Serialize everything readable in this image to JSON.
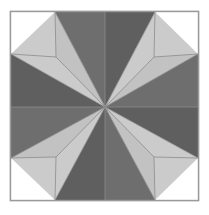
{
  "figure": {
    "name": "eight-pointed-star-quilt-block",
    "canvas": {
      "width": 209,
      "height": 215
    },
    "background_color": "#ffffff"
  },
  "palette": {
    "background": "#ffffff",
    "dark_gray": "#6e6e6e",
    "light_gray": "#cbcbcb",
    "white_patch": "#ffffff",
    "outline": "#8c8c8c",
    "border": "#9a9a9a"
  },
  "block": {
    "frame": {
      "name": "outer-border-square",
      "x": 10.5,
      "y": 11.5,
      "width": 188,
      "height": 189,
      "stroke": "#9a9a9a",
      "stroke_width": 1.4,
      "fill": "#ffffff"
    },
    "center": {
      "x": 105,
      "y": 107
    },
    "star_points": 8,
    "geometry_note": "Eight elongated diamonds meet at the center; tips land on the frame corners and on frame edge midpoints.",
    "diamonds": [
      {
        "name": "star-diamond-n",
        "direction": "north",
        "shade": "dark",
        "fill": "#6e6e6e",
        "points": "105,107 55,12 105,12 155,12"
      },
      {
        "name": "star-diamond-ne",
        "direction": "northeast",
        "shade": "light",
        "fill": "#cbcbcb",
        "points": "105,107 155,12 198,54 154,57"
      },
      {
        "name": "star-diamond-e",
        "direction": "east",
        "shade": "dark",
        "fill": "#6e6e6e",
        "points": "105,107 198,54 198,107 198,158"
      },
      {
        "name": "star-diamond-se",
        "direction": "southeast",
        "shade": "light",
        "fill": "#cbcbcb",
        "points": "105,107 198,158 155,200 154,157"
      },
      {
        "name": "star-diamond-s",
        "direction": "south",
        "shade": "dark",
        "fill": "#6e6e6e",
        "points": "105,107 155,200 105,200 55,200"
      },
      {
        "name": "star-diamond-sw",
        "direction": "southwest",
        "shade": "light",
        "fill": "#cbcbcb",
        "points": "105,107 55,200 11,158 56,157"
      },
      {
        "name": "star-diamond-w",
        "direction": "west",
        "shade": "dark",
        "fill": "#6e6e6e",
        "points": "105,107 11,158 11,107 11,54"
      },
      {
        "name": "star-diamond-nw",
        "direction": "northwest",
        "shade": "light",
        "fill": "#cbcbcb",
        "points": "105,107 11,54 55,12 56,57"
      }
    ],
    "corner_patches": [
      {
        "name": "corner-square-nw",
        "corner": "top-left",
        "fill": "#ffffff",
        "points": "11,12 55,12 56,57 11,54"
      },
      {
        "name": "corner-square-ne",
        "corner": "top-right",
        "fill": "#ffffff",
        "points": "155,12 198,12 198,54 154,57"
      },
      {
        "name": "corner-square-se",
        "corner": "bottom-right",
        "fill": "#ffffff",
        "points": "198,158 198,200 155,200 154,157"
      },
      {
        "name": "corner-square-sw",
        "corner": "bottom-left",
        "fill": "#ffffff",
        "points": "11,158 56,157 55,200 11,200"
      }
    ],
    "edge_triangles": [
      {
        "name": "edge-triangle-north",
        "edge": "top",
        "fill": "#ffffff",
        "points": "55,12 155,12 105,107"
      },
      {
        "name": "edge-triangle-east",
        "edge": "right",
        "fill": "#ffffff",
        "points": "198,54 198,158 105,107"
      },
      {
        "name": "edge-triangle-south",
        "edge": "bottom",
        "fill": "#ffffff",
        "points": "55,200 155,200 105,107"
      },
      {
        "name": "edge-triangle-west",
        "edge": "left",
        "fill": "#ffffff",
        "points": "11,54 11,158 105,107"
      }
    ],
    "diamond_halves": [
      {
        "name": "diamond-half-n-left",
        "parent": "north",
        "fill": "#6e6e6e",
        "points": "105,107 55,12 105,12"
      },
      {
        "name": "diamond-half-n-right",
        "parent": "north",
        "fill": "#5f5f5f",
        "points": "105,107 105,12 155,12"
      },
      {
        "name": "diamond-half-ne-out",
        "parent": "northeast",
        "fill": "#cbcbcb",
        "points": "105,107 155,12 198,54"
      },
      {
        "name": "diamond-half-ne-in",
        "parent": "northeast",
        "fill": "#c2c2c2",
        "points": "105,107 198,54 154,57"
      },
      {
        "name": "diamond-half-e-top",
        "parent": "east",
        "fill": "#6e6e6e",
        "points": "105,107 198,54 198,107"
      },
      {
        "name": "diamond-half-e-bot",
        "parent": "east",
        "fill": "#5f5f5f",
        "points": "105,107 198,107 198,158"
      },
      {
        "name": "diamond-half-se-out",
        "parent": "southeast",
        "fill": "#cbcbcb",
        "points": "105,107 198,158 155,200"
      },
      {
        "name": "diamond-half-se-in",
        "parent": "southeast",
        "fill": "#c2c2c2",
        "points": "105,107 155,200 154,157"
      },
      {
        "name": "diamond-half-s-right",
        "parent": "south",
        "fill": "#6e6e6e",
        "points": "105,107 155,200 105,200"
      },
      {
        "name": "diamond-half-s-left",
        "parent": "south",
        "fill": "#5f5f5f",
        "points": "105,107 105,200 55,200"
      },
      {
        "name": "diamond-half-sw-out",
        "parent": "southwest",
        "fill": "#cbcbcb",
        "points": "105,107 55,200 11,158"
      },
      {
        "name": "diamond-half-sw-in",
        "parent": "southwest",
        "fill": "#c2c2c2",
        "points": "105,107 11,158 56,157"
      },
      {
        "name": "diamond-half-w-bot",
        "parent": "west",
        "fill": "#6e6e6e",
        "points": "105,107 11,158 11,107"
      },
      {
        "name": "diamond-half-w-top",
        "parent": "west",
        "fill": "#5f5f5f",
        "points": "105,107 11,107 11,54"
      },
      {
        "name": "diamond-half-nw-out",
        "parent": "northwest",
        "fill": "#cbcbcb",
        "points": "105,107 11,54 55,12"
      },
      {
        "name": "diamond-half-nw-in",
        "parent": "northwest",
        "fill": "#c2c2c2",
        "points": "105,107 55,12 56,57"
      }
    ],
    "seam_lines": [
      {
        "name": "seam-center-to-nw-corner",
        "x1": 11,
        "y1": 54,
        "x2": 105,
        "y2": 107
      },
      {
        "name": "seam-center-to-n-left",
        "x1": 55,
        "y1": 12,
        "x2": 105,
        "y2": 107
      },
      {
        "name": "seam-center-to-n-mid",
        "x1": 105,
        "y1": 12,
        "x2": 105,
        "y2": 107
      },
      {
        "name": "seam-center-to-n-right",
        "x1": 155,
        "y1": 12,
        "x2": 105,
        "y2": 107
      },
      {
        "name": "seam-center-to-ne-corner",
        "x1": 198,
        "y1": 54,
        "x2": 105,
        "y2": 107
      },
      {
        "name": "seam-center-to-e-mid",
        "x1": 198,
        "y1": 107,
        "x2": 105,
        "y2": 107
      },
      {
        "name": "seam-center-to-se-corner",
        "x1": 198,
        "y1": 158,
        "x2": 105,
        "y2": 107
      },
      {
        "name": "seam-center-to-s-right",
        "x1": 155,
        "y1": 200,
        "x2": 105,
        "y2": 107
      },
      {
        "name": "seam-center-to-s-mid",
        "x1": 105,
        "y1": 200,
        "x2": 105,
        "y2": 107
      },
      {
        "name": "seam-center-to-s-left",
        "x1": 55,
        "y1": 200,
        "x2": 105,
        "y2": 107
      },
      {
        "name": "seam-center-to-sw-corner",
        "x1": 11,
        "y1": 158,
        "x2": 105,
        "y2": 107
      },
      {
        "name": "seam-center-to-w-mid",
        "x1": 11,
        "y1": 107,
        "x2": 105,
        "y2": 107
      },
      {
        "name": "seam-inner-nw",
        "x1": 56,
        "y1": 57,
        "x2": 105,
        "y2": 107
      },
      {
        "name": "seam-inner-ne",
        "x1": 154,
        "y1": 57,
        "x2": 105,
        "y2": 107
      },
      {
        "name": "seam-inner-se",
        "x1": 154,
        "y1": 157,
        "x2": 105,
        "y2": 107
      },
      {
        "name": "seam-inner-sw",
        "x1": 56,
        "y1": 157,
        "x2": 105,
        "y2": 107
      },
      {
        "name": "seam-corner-nw-bottom",
        "x1": 11,
        "y1": 54,
        "x2": 56,
        "y2": 57
      },
      {
        "name": "seam-corner-nw-right",
        "x1": 56,
        "y1": 57,
        "x2": 55,
        "y2": 12
      },
      {
        "name": "seam-corner-ne-bottom",
        "x1": 154,
        "y1": 57,
        "x2": 198,
        "y2": 54
      },
      {
        "name": "seam-corner-ne-left",
        "x1": 155,
        "y1": 12,
        "x2": 154,
        "y2": 57
      },
      {
        "name": "seam-corner-se-top",
        "x1": 154,
        "y1": 157,
        "x2": 198,
        "y2": 158
      },
      {
        "name": "seam-corner-se-left",
        "x1": 154,
        "y1": 157,
        "x2": 155,
        "y2": 200
      },
      {
        "name": "seam-corner-sw-top",
        "x1": 11,
        "y1": 158,
        "x2": 56,
        "y2": 157
      },
      {
        "name": "seam-corner-sw-right",
        "x1": 56,
        "y1": 157,
        "x2": 55,
        "y2": 200
      }
    ]
  }
}
